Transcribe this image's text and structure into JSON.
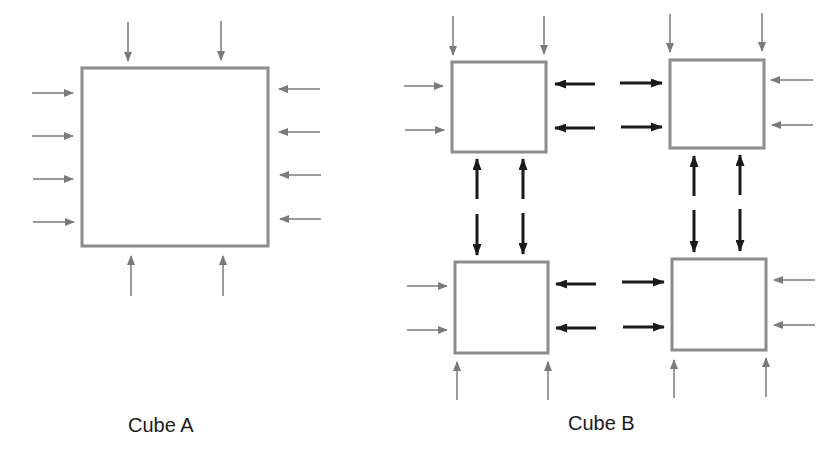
{
  "colors": {
    "box_stroke": "#8c8c8c",
    "external_arrow": "#7a7a7a",
    "internal_arrow": "#1a1a1a",
    "caption": "#1a1a1a"
  },
  "cube_a": {
    "label": "Cube A",
    "box": {
      "x": 82,
      "y": 68,
      "w": 186,
      "h": 178
    },
    "arrows": {
      "top": 2,
      "bottom": 2,
      "left": 4,
      "right": 4
    }
  },
  "cube_b": {
    "label": "Cube B",
    "boxes": [
      {
        "name": "top-left",
        "x": 452,
        "y": 62,
        "w": 94,
        "h": 90
      },
      {
        "name": "top-right",
        "x": 670,
        "y": 60,
        "w": 94,
        "h": 88
      },
      {
        "name": "bottom-left",
        "x": 455,
        "y": 262,
        "w": 93,
        "h": 91
      },
      {
        "name": "bottom-right",
        "x": 672,
        "y": 259,
        "w": 94,
        "h": 91
      }
    ],
    "external_arrows_per_box": 4,
    "internal_bidirectional_links": 8
  }
}
